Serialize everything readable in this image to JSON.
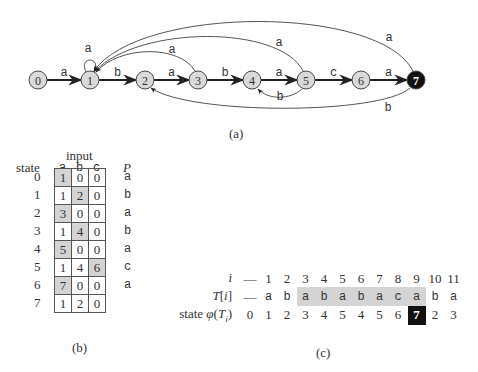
{
  "automaton": {
    "caption": "(a)",
    "states": [
      {
        "id": "0",
        "x": 38,
        "accepting": false
      },
      {
        "id": "1",
        "x": 90,
        "accepting": false
      },
      {
        "id": "2",
        "x": 145,
        "accepting": false
      },
      {
        "id": "3",
        "x": 198,
        "accepting": false
      },
      {
        "id": "4",
        "x": 252,
        "accepting": false
      },
      {
        "id": "5",
        "x": 306,
        "accepting": false
      },
      {
        "id": "6",
        "x": 361,
        "accepting": false
      },
      {
        "id": "7",
        "x": 416,
        "accepting": true
      }
    ],
    "forward_edges": [
      {
        "from": "0",
        "to": "1",
        "label": "a"
      },
      {
        "from": "1",
        "to": "2",
        "label": "b"
      },
      {
        "from": "2",
        "to": "3",
        "label": "a"
      },
      {
        "from": "3",
        "to": "4",
        "label": "b"
      },
      {
        "from": "4",
        "to": "5",
        "label": "a"
      },
      {
        "from": "5",
        "to": "6",
        "label": "c"
      },
      {
        "from": "6",
        "to": "7",
        "label": "a"
      }
    ],
    "back_edges": [
      {
        "from": "1",
        "to": "1",
        "label": "a"
      },
      {
        "from": "3",
        "to": "1",
        "label": "a"
      },
      {
        "from": "5",
        "to": "1",
        "label": "a"
      },
      {
        "from": "7",
        "to": "1",
        "label": "a"
      },
      {
        "from": "5",
        "to": "4",
        "label": "b"
      },
      {
        "from": "7",
        "to": "2",
        "label": "b"
      }
    ]
  },
  "transition_table": {
    "caption": "(b)",
    "input_header": "input",
    "state_header": "state",
    "pattern_header": "P",
    "columns": [
      "a",
      "b",
      "c"
    ],
    "rows": [
      {
        "state": "0",
        "values": [
          "1",
          "0",
          "0"
        ],
        "highlight": 0,
        "p": "a"
      },
      {
        "state": "1",
        "values": [
          "1",
          "2",
          "0"
        ],
        "highlight": 1,
        "p": "b"
      },
      {
        "state": "2",
        "values": [
          "3",
          "0",
          "0"
        ],
        "highlight": 0,
        "p": "a"
      },
      {
        "state": "3",
        "values": [
          "1",
          "4",
          "0"
        ],
        "highlight": 1,
        "p": "b"
      },
      {
        "state": "4",
        "values": [
          "5",
          "0",
          "0"
        ],
        "highlight": 0,
        "p": "a"
      },
      {
        "state": "5",
        "values": [
          "1",
          "4",
          "6"
        ],
        "highlight": 2,
        "p": "c"
      },
      {
        "state": "6",
        "values": [
          "7",
          "0",
          "0"
        ],
        "highlight": 0,
        "p": "a"
      },
      {
        "state": "7",
        "values": [
          "1",
          "2",
          "0"
        ],
        "highlight": -1,
        "p": ""
      }
    ]
  },
  "trace": {
    "caption": "(c)",
    "row_labels": {
      "i": "i",
      "t": "T[i]",
      "state": "state φ(T_i)"
    },
    "i": [
      "—",
      "1",
      "2",
      "3",
      "4",
      "5",
      "6",
      "7",
      "8",
      "9",
      "10",
      "11"
    ],
    "t": [
      "—",
      "a",
      "b",
      "a",
      "b",
      "a",
      "b",
      "a",
      "c",
      "a",
      "b",
      "a"
    ],
    "state": [
      "0",
      "1",
      "2",
      "3",
      "4",
      "5",
      "4",
      "5",
      "6",
      "7",
      "2",
      "3"
    ],
    "match_range": [
      3,
      9
    ],
    "accept_index": 9
  },
  "colors": {
    "node_fill": "#d9d9d9",
    "accept_fill": "#111111",
    "highlight": "#d4d4d4",
    "edge": "#333333"
  }
}
